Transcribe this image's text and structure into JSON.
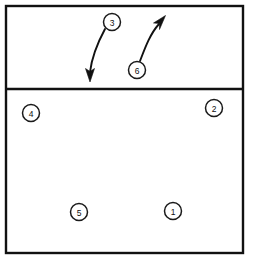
{
  "diagram": {
    "background_color": "#ffffff",
    "line_color": "#111111",
    "court": {
      "name": "court-boundary",
      "x": 6,
      "y": 6,
      "width": 237,
      "height": 247,
      "stroke_width": 2.4
    },
    "attack_line": {
      "name": "attack-line",
      "y": 89,
      "x1": 6,
      "x2": 243,
      "stroke_width": 2.4
    },
    "players": [
      {
        "label": "3",
        "cx": 112,
        "cy": 22,
        "r": 8.5,
        "zone": "front-court"
      },
      {
        "label": "6",
        "cx": 137,
        "cy": 70,
        "r": 8.5,
        "zone": "front-court"
      },
      {
        "label": "4",
        "cx": 31,
        "cy": 113,
        "r": 8.5,
        "zone": "back-court"
      },
      {
        "label": "2",
        "cx": 214,
        "cy": 108,
        "r": 8.5,
        "zone": "back-court"
      },
      {
        "label": "5",
        "cx": 79,
        "cy": 212,
        "r": 8.5,
        "zone": "back-court"
      },
      {
        "label": "1",
        "cx": 173,
        "cy": 211,
        "r": 8.5,
        "zone": "back-court"
      }
    ],
    "movements": [
      {
        "name": "movement-arrow-3",
        "from_player": "3",
        "path": "M 105 29 C 98 42 92 56 90 72",
        "arrowhead": "M 90 82 L 85.5 68.5 L 90 71.5 L 94.5 68.5 Z",
        "direction": "down-left"
      },
      {
        "name": "movement-arrow-6",
        "from_player": "6",
        "path": "M 140 61 C 145 48 150 34 159 24",
        "arrowhead": "M 165.5 15.5 L 159.5 29.5 L 159.5 23.5 L 153.5 23 Z",
        "direction": "up-right"
      }
    ]
  }
}
